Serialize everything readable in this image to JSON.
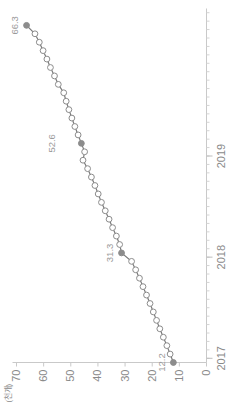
{
  "chart_data": {
    "type": "line",
    "title": "",
    "subtitle": "",
    "orientation": "rotated-90-ccw",
    "unit_label": "(천개)",
    "xlabel": "",
    "ylabel": "",
    "grid": false,
    "legend": "none",
    "xlim": [
      0,
      42
    ],
    "ylim": [
      0,
      70
    ],
    "yticks": [
      0,
      10,
      20,
      30,
      40,
      50,
      60,
      70
    ],
    "ytick_labels": [
      "0",
      "10",
      "20",
      "30",
      "40",
      "50",
      "60",
      "70"
    ],
    "xtick_labels": [
      "2017",
      "2018",
      "2019"
    ],
    "xtick_positions": [
      0.5,
      12.5,
      24.5
    ],
    "x_minor_tick_count": 42,
    "marker_style": "open-circle",
    "marker_fill": "#ffffff",
    "marker_edge": "#8c8c8c",
    "line_color": "#7a7a7a",
    "highlight_marker_fill": "#8c8c8c",
    "annotations": [
      {
        "index": 0,
        "value": 12.2,
        "label": "12.2",
        "highlighted": true
      },
      {
        "index": 13,
        "value": 31.3,
        "label": "31.3",
        "highlighted": true
      },
      {
        "index": 26,
        "value": 52.6,
        "label": "52.6",
        "highlighted": true
      },
      {
        "index": 40,
        "value": 66.3,
        "label": "66.3",
        "highlighted": true
      }
    ],
    "x": [
      0,
      1,
      2,
      3,
      4,
      5,
      6,
      7,
      8,
      9,
      10,
      11,
      12,
      13,
      14,
      15,
      16,
      17,
      18,
      19,
      20,
      21,
      22,
      23,
      24,
      25,
      26,
      27,
      28,
      29,
      30,
      31,
      32,
      33,
      34,
      35,
      36,
      37,
      38,
      39,
      40
    ],
    "values": [
      12.2,
      13.4,
      14.6,
      15.9,
      17.2,
      18.4,
      19.6,
      20.8,
      22.1,
      23.4,
      24.7,
      26.1,
      27.6,
      31.3,
      32.0,
      33.2,
      34.6,
      35.9,
      37.3,
      38.7,
      39.9,
      41.1,
      42.4,
      43.8,
      45.5,
      44.9,
      46.1,
      47.3,
      48.5,
      49.6,
      50.7,
      51.7,
      52.6,
      54.6,
      56.0,
      57.5,
      58.8,
      60.2,
      61.6,
      63.2,
      66.3
    ]
  },
  "yaxis": {
    "unit": "(천개)"
  }
}
